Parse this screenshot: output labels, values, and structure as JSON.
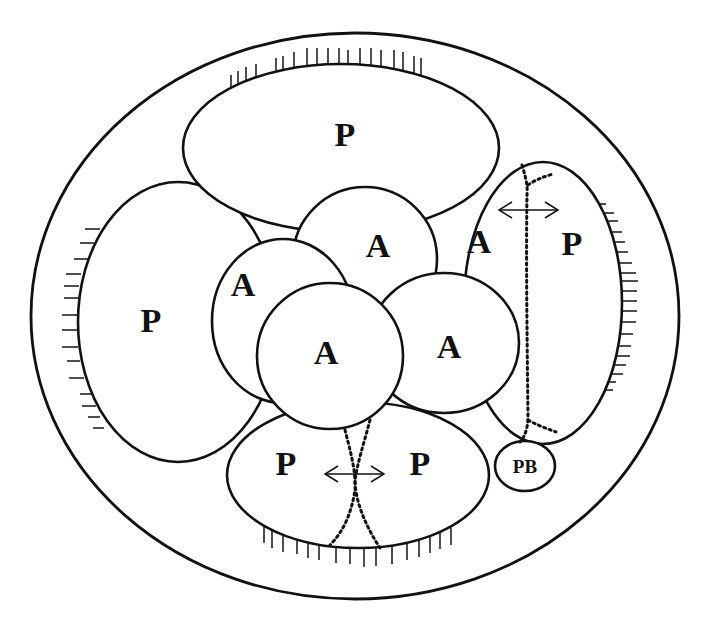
{
  "diagram": {
    "type": "embryo-cell-lineage-schematic",
    "labels": {
      "p_top": "P",
      "p_left": "P",
      "p_right": "P",
      "p_bottom_left": "P",
      "p_bottom_right": "P",
      "a_top": "A",
      "a_left": "A",
      "a_center": "A",
      "a_right": "A",
      "a_right_outside": "A",
      "polar_body": "PB"
    },
    "cells": [
      {
        "id": "outer-envelope",
        "label": ""
      },
      {
        "id": "p-top",
        "label": "P"
      },
      {
        "id": "p-left",
        "label": "P"
      },
      {
        "id": "p-right",
        "label": "P"
      },
      {
        "id": "p-bottom",
        "label": "P P"
      },
      {
        "id": "a-top",
        "label": "A"
      },
      {
        "id": "a-left",
        "label": "A"
      },
      {
        "id": "a-center",
        "label": "A"
      },
      {
        "id": "a-right",
        "label": "A"
      },
      {
        "id": "polar-body",
        "label": "PB"
      }
    ],
    "annotations": {
      "right_arrow": "double-headed arrow across dotted division line",
      "bottom_arrow": "double-headed arrow across dotted division line",
      "hatching": "short tick marks along outer edge of P cells"
    },
    "colors": {
      "stroke": "#111111",
      "background": "#ffffff"
    }
  }
}
